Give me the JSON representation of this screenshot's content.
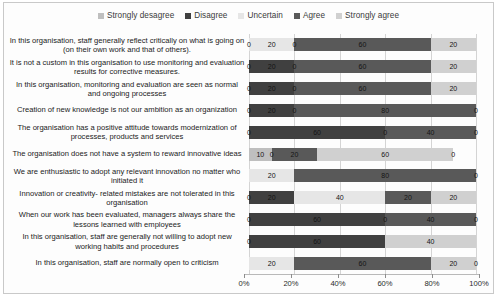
{
  "chart_data": {
    "type": "bar",
    "orientation": "horizontal",
    "stacked": true,
    "stack_mode": "percent",
    "title": "",
    "xlabel": "",
    "ylabel": "",
    "xlim": [
      0,
      100
    ],
    "xticks": [
      0,
      20,
      40,
      60,
      80,
      100
    ],
    "xticklabels": [
      "0%",
      "20%",
      "40%",
      "60%",
      "80%",
      "100%"
    ],
    "grid": true,
    "legend_position": "top-center",
    "legend": [
      "Strongly desagree",
      "Disagree",
      "Uncertain",
      "Agree",
      "Strongly agree"
    ],
    "colors": [
      "#bfbfbf",
      "#404040",
      "#e6e6e6",
      "#595959",
      "#d0d0d0"
    ],
    "categories": [
      "In this organisation, staff generally reflect critically on what is going on (on their own work and that of others).",
      "It is not a custom in this organisation to use monitoring and evaluation results for corrective measures.",
      "In this organisation, monitoring and evaluation are seen as normal and ongoing processes",
      "Creation of new knowledge is not our ambition as an organization",
      "The organisation has a positive attitude towards modernization of processes, products and services",
      "The organisation does not have a system to reward innovative ideas",
      "We are enthusiastic to adopt any relevant innovation no matter who initiated it",
      "Innovation or creativity- related mistakes are not tolerated in this organisation",
      "When our work has been evaluated, managers always share the lessons learned with employees",
      "In this organisation, staff are generally not willing to adopt new working habits and procedures",
      "In this organisation, staff are normally open to criticism"
    ],
    "series": [
      {
        "name": "Strongly desagree",
        "values": [
          0,
          20,
          20,
          20,
          0,
          10,
          0,
          0,
          0,
          0,
          0
        ]
      },
      {
        "name": "Disagree",
        "values": [
          20,
          0,
          0,
          0,
          0,
          0,
          0,
          20,
          0,
          0,
          0
        ]
      },
      {
        "name": "Uncertain",
        "values": [
          0,
          0,
          0,
          0,
          0,
          20,
          20,
          40,
          0,
          0,
          20
        ]
      },
      {
        "name": "Agree",
        "values": [
          60,
          60,
          60,
          80,
          60,
          0,
          80,
          20,
          60,
          60,
          60
        ]
      },
      {
        "name": "Strongly agree",
        "values": [
          20,
          20,
          20,
          0,
          40,
          60,
          0,
          20,
          40,
          40,
          20
        ]
      }
    ],
    "rows": [
      {
        "label": "In this organisation, staff generally reflect critically on what is going on (on their own work and that of others).",
        "segments": [
          {
            "series": "Strongly desagree",
            "value": 0,
            "label": "0"
          },
          {
            "series": "Uncertain",
            "value": 20,
            "label": "20"
          },
          {
            "series": "Disagree",
            "value": 0,
            "label": "0"
          },
          {
            "series": "Agree",
            "value": 60,
            "label": "60"
          },
          {
            "series": "Strongly agree",
            "value": 20,
            "label": "20"
          }
        ]
      },
      {
        "label": "It is not a custom in this organisation to use monitoring and evaluation results for corrective measures.",
        "segments": [
          {
            "series": "Strongly desagree",
            "value": 0,
            "label": "0"
          },
          {
            "series": "Disagree",
            "value": 20,
            "label": "20"
          },
          {
            "series": "Uncertain",
            "value": 0,
            "label": "0"
          },
          {
            "series": "Agree",
            "value": 60,
            "label": "60"
          },
          {
            "series": "Strongly agree",
            "value": 20,
            "label": "20"
          }
        ]
      },
      {
        "label": "In this organisation, monitoring and evaluation are seen as normal and ongoing processes",
        "segments": [
          {
            "series": "Strongly desagree",
            "value": 0,
            "label": "0"
          },
          {
            "series": "Disagree",
            "value": 20,
            "label": "20"
          },
          {
            "series": "Uncertain",
            "value": 0,
            "label": "0"
          },
          {
            "series": "Agree",
            "value": 60,
            "label": "60"
          },
          {
            "series": "Strongly agree",
            "value": 20,
            "label": "20"
          }
        ]
      },
      {
        "label": "Creation of new knowledge is not our ambition as an organization",
        "segments": [
          {
            "series": "Strongly desagree",
            "value": 0,
            "label": "0"
          },
          {
            "series": "Disagree",
            "value": 20,
            "label": "20"
          },
          {
            "series": "Uncertain",
            "value": 0,
            "label": "0"
          },
          {
            "series": "Agree",
            "value": 80,
            "label": "80"
          },
          {
            "series": "Strongly agree",
            "value": 0,
            "label": "0"
          }
        ]
      },
      {
        "label": "The organisation has a positive attitude towards modernization of processes, products and services",
        "segments": [
          {
            "series": "Strongly desagree",
            "value": 0,
            "label": "0"
          },
          {
            "series": "Disagree",
            "value": 60,
            "label": "60"
          },
          {
            "series": "Uncertain",
            "value": 0,
            "label": "0"
          },
          {
            "series": "Agree",
            "value": 40,
            "label": "40"
          },
          {
            "series": "Strongly agree",
            "value": 0,
            "label": "0"
          }
        ]
      },
      {
        "label": "The organisation does not have a system to reward innovative ideas",
        "segments": [
          {
            "series": "Strongly desagree",
            "value": 10,
            "label": "10"
          },
          {
            "series": "Disagree",
            "value": 0,
            "label": "0"
          },
          {
            "series": "Agree",
            "value": 20,
            "label": "20"
          },
          {
            "series": "Strongly agree",
            "value": 60,
            "label": "60"
          },
          {
            "series": "Uncertain",
            "value": 0,
            "label": "0"
          }
        ]
      },
      {
        "label": "We are enthusiastic to adopt any relevant innovation no matter who initiated it",
        "segments": [
          {
            "series": "Uncertain",
            "value": 20,
            "label": "20"
          },
          {
            "series": "Agree",
            "value": 80,
            "label": "80"
          },
          {
            "series": "Strongly agree",
            "value": 0,
            "label": "0"
          }
        ]
      },
      {
        "label": "Innovation or creativity- related mistakes are not tolerated in this organisation",
        "segments": [
          {
            "series": "Strongly desagree",
            "value": 0,
            "label": "0"
          },
          {
            "series": "Disagree",
            "value": 20,
            "label": "20"
          },
          {
            "series": "Uncertain",
            "value": 40,
            "label": "40"
          },
          {
            "series": "Agree",
            "value": 20,
            "label": "20"
          },
          {
            "series": "Strongly agree",
            "value": 20,
            "label": "20"
          }
        ]
      },
      {
        "label": "When our work has been evaluated, managers always share the lessons learned with employees",
        "segments": [
          {
            "series": "Strongly desagree",
            "value": 0,
            "label": "0"
          },
          {
            "series": "Disagree",
            "value": 60,
            "label": "60"
          },
          {
            "series": "Uncertain",
            "value": 0,
            "label": "0"
          },
          {
            "series": "Agree",
            "value": 40,
            "label": "40"
          },
          {
            "series": "Strongly agree",
            "value": 0,
            "label": "0"
          }
        ]
      },
      {
        "label": "In this organisation, staff are generally not willing to adopt new working habits and procedures",
        "segments": [
          {
            "series": "Strongly desagree",
            "value": 0,
            "label": "0"
          },
          {
            "series": "Disagree",
            "value": 60,
            "label": "60"
          },
          {
            "series": "Strongly agree",
            "value": 40,
            "label": "40"
          }
        ]
      },
      {
        "label": "In this organisation, staff are normally open to criticism",
        "segments": [
          {
            "series": "Uncertain",
            "value": 20,
            "label": "20"
          },
          {
            "series": "Agree",
            "value": 60,
            "label": "60"
          },
          {
            "series": "Strongly agree",
            "value": 20,
            "label": "20"
          },
          {
            "series": "Disagree",
            "value": 0,
            "label": "0"
          }
        ]
      }
    ]
  }
}
